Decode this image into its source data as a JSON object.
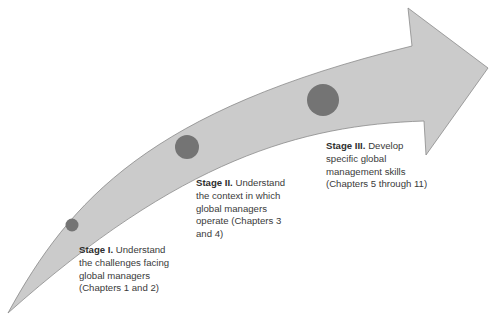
{
  "diagram": {
    "type": "curved-arrow-stages",
    "colors": {
      "arrow_fill": "#cbcbcb",
      "arrow_stroke": "#8a8a8a",
      "circle_fill": "#747474",
      "text": "#3a3a3a",
      "background": "#ffffff"
    },
    "stages": [
      {
        "title": "Stage I.",
        "lines": [
          "Understand",
          "the challenges facing",
          "global managers",
          "(Chapters 1 and 2)"
        ],
        "circle": {
          "cx": 72,
          "cy": 225,
          "r": 6.5
        }
      },
      {
        "title": "Stage II.",
        "lines": [
          "Understand",
          "the context in which",
          "global managers",
          "operate (Chapters 3",
          "and 4)"
        ],
        "circle": {
          "cx": 187,
          "cy": 147,
          "r": 12
        }
      },
      {
        "title": "Stage III.",
        "lines": [
          "Develop",
          "specific global",
          "management skills",
          "(Chapters 5 through 11)"
        ],
        "circle": {
          "cx": 323,
          "cy": 100,
          "r": 16
        }
      }
    ]
  }
}
